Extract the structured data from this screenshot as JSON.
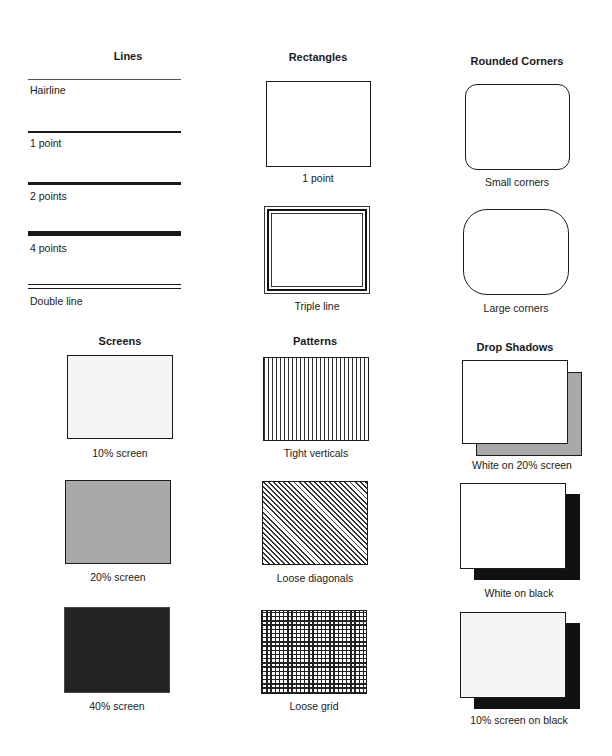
{
  "sections": {
    "lines": {
      "heading": "Lines",
      "items": [
        {
          "label": "Hairline",
          "weight": "hairline"
        },
        {
          "label": "1 point",
          "weight": "1pt"
        },
        {
          "label": "2 points",
          "weight": "2pt"
        },
        {
          "label": "4 points",
          "weight": "4pt"
        },
        {
          "label": "Double line",
          "weight": "double"
        }
      ]
    },
    "rectangles": {
      "heading": "Rectangles",
      "items": [
        {
          "label": "1 point"
        },
        {
          "label": "Triple line"
        }
      ]
    },
    "rounded_corners": {
      "heading": "Rounded Corners",
      "items": [
        {
          "label": "Small corners"
        },
        {
          "label": "Large corners"
        }
      ]
    },
    "screens": {
      "heading": "Screens",
      "items": [
        {
          "label": "10% screen",
          "fill": "#f4f4f4"
        },
        {
          "label": "20% screen",
          "fill": "#a9a9a9"
        },
        {
          "label": "40% screen",
          "fill": "#232323"
        }
      ]
    },
    "patterns": {
      "heading": "Patterns",
      "items": [
        {
          "label": "Tight verticals",
          "pattern": "vertical-lines"
        },
        {
          "label": "Loose diagonals",
          "pattern": "diagonal-lines"
        },
        {
          "label": "Loose grid",
          "pattern": "grid"
        }
      ]
    },
    "drop_shadows": {
      "heading": "Drop Shadows",
      "items": [
        {
          "label": "White on 20% screen",
          "front": "#ffffff",
          "shadow": "#a9a9a9"
        },
        {
          "label": "White on black",
          "front": "#ffffff",
          "shadow": "#111111"
        },
        {
          "label": "10% screen on black",
          "front": "#f4f4f4",
          "shadow": "#111111"
        }
      ]
    }
  }
}
